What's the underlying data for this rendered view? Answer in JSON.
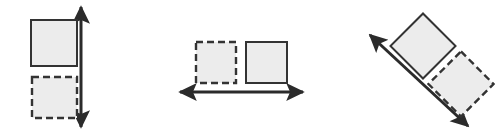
{
  "figure": {
    "name": "translation-vector-diagram",
    "width": 504,
    "height": 135,
    "background_color": "#ffffff"
  },
  "style": {
    "shape_fill": "#ececec",
    "shape_stroke": "#333333",
    "shape_stroke_width": 2,
    "dash_pattern": "7 4",
    "arrow_color": "#2b2b2b",
    "arrow_stroke_width": 3
  },
  "panels": [
    {
      "id": "panel-vertical",
      "label": "vertical-translation",
      "arrow": {
        "name": "vertical-double-arrow",
        "direction": "vertical",
        "x1": 81,
        "y1": 7,
        "x2": 81,
        "y2": 127,
        "heads": "both"
      },
      "shapes": [
        {
          "name": "solid-square-top",
          "style": "solid",
          "x": 31,
          "y": 20,
          "width": 46,
          "height": 46,
          "rotation": 0
        },
        {
          "name": "dashed-square-bottom",
          "style": "dashed",
          "x": 32,
          "y": 77,
          "width": 45,
          "height": 41,
          "rotation": 0
        }
      ]
    },
    {
      "id": "panel-horizontal",
      "label": "horizontal-translation",
      "arrow": {
        "name": "horizontal-double-arrow",
        "direction": "horizontal",
        "x1": 180,
        "y1": 92,
        "x2": 303,
        "y2": 92,
        "heads": "both"
      },
      "shapes": [
        {
          "name": "dashed-square-left",
          "style": "dashed",
          "x": 196,
          "y": 42,
          "width": 40,
          "height": 41,
          "rotation": 0
        },
        {
          "name": "solid-square-right",
          "style": "solid",
          "x": 246,
          "y": 42,
          "width": 41,
          "height": 41,
          "rotation": 0
        }
      ]
    },
    {
      "id": "panel-diagonal",
      "label": "diagonal-translation",
      "arrow": {
        "name": "diagonal-double-arrow",
        "direction": "diagonal",
        "x1": 370,
        "y1": 35,
        "x2": 468,
        "y2": 126,
        "heads": "both"
      },
      "shapes": [
        {
          "name": "solid-square-rotated-upper",
          "style": "solid",
          "cx": 423,
          "cy": 46,
          "width": 46,
          "height": 46,
          "rotation": 45
        },
        {
          "name": "dashed-square-rotated-lower",
          "style": "dashed",
          "cx": 461,
          "cy": 84,
          "width": 46,
          "height": 46,
          "rotation": 45
        }
      ]
    }
  ]
}
